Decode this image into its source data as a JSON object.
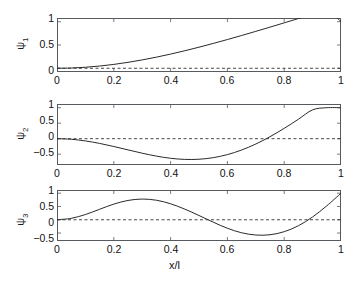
{
  "figure": {
    "background_color": "#ffffff",
    "axis_color": "#555b5e",
    "curve_color": "#2a2a2a",
    "zeroline_color": "#333333"
  },
  "xlabel": "x/l",
  "xticks": [
    "0",
    "0.2",
    "0.4",
    "0.6",
    "0.8",
    "1"
  ],
  "panels": [
    {
      "ylabel_main": "ψ",
      "ylabel_sub": "1",
      "yticks": [
        "1",
        "0.5",
        "0"
      ]
    },
    {
      "ylabel_main": "ψ",
      "ylabel_sub": "2",
      "yticks": [
        "1",
        "0.5",
        "0",
        "−0.5"
      ]
    },
    {
      "ylabel_main": "ψ",
      "ylabel_sub": "3",
      "yticks": [
        "1",
        "0.5",
        "0",
        "−0.5"
      ]
    }
  ],
  "chart_data": [
    {
      "type": "line",
      "title": "",
      "xlabel": "",
      "ylabel": "ψ₁",
      "xlim": [
        0,
        1
      ],
      "ylim": [
        -0.08,
        1.08
      ],
      "xticks": [
        0,
        0.2,
        0.4,
        0.6,
        0.8,
        1
      ],
      "yticks": [
        0,
        0.5,
        1
      ],
      "grid": false,
      "legend": null,
      "series": [
        {
          "name": "psi_1",
          "style": "solid",
          "x": [
            0,
            0.05,
            0.1,
            0.15,
            0.2,
            0.25,
            0.3,
            0.35,
            0.4,
            0.45,
            0.5,
            0.55,
            0.6,
            0.65,
            0.7,
            0.75,
            0.8,
            0.85,
            0.9,
            0.95,
            1
          ],
          "values": [
            0,
            0.0055,
            0.0216,
            0.0477,
            0.0832,
            0.1275,
            0.1797,
            0.2391,
            0.3049,
            0.3763,
            0.4527,
            0.5332,
            0.6172,
            0.7041,
            0.7932,
            0.8839,
            0.9758,
            1.0683,
            1.161,
            1.2535,
            1.0
          ]
        },
        {
          "name": "zero_reference",
          "style": "dashed",
          "x": [
            0,
            1
          ],
          "values": [
            0,
            0
          ]
        }
      ]
    },
    {
      "type": "line",
      "title": "",
      "xlabel": "",
      "ylabel": "ψ₂",
      "xlim": [
        0,
        1
      ],
      "ylim": [
        -0.85,
        1.12
      ],
      "xticks": [
        0,
        0.2,
        0.4,
        0.6,
        0.8,
        1
      ],
      "yticks": [
        -0.5,
        0,
        0.5,
        1
      ],
      "grid": false,
      "legend": null,
      "series": [
        {
          "name": "psi_2",
          "style": "solid",
          "x": [
            0,
            0.05,
            0.1,
            0.15,
            0.2,
            0.25,
            0.3,
            0.35,
            0.4,
            0.45,
            0.5,
            0.55,
            0.6,
            0.65,
            0.7,
            0.75,
            0.8,
            0.85,
            0.9,
            0.95,
            1
          ],
          "values": [
            0,
            -0.019,
            -0.072,
            -0.153,
            -0.253,
            -0.362,
            -0.469,
            -0.563,
            -0.633,
            -0.669,
            -0.664,
            -0.613,
            -0.514,
            -0.366,
            -0.172,
            0.064,
            0.334,
            0.628,
            0.932,
            1.0,
            1.0
          ]
        },
        {
          "name": "zero_reference",
          "style": "dashed",
          "x": [
            0,
            1
          ],
          "values": [
            0,
            0
          ]
        }
      ]
    },
    {
      "type": "line",
      "title": "",
      "xlabel": "x/l",
      "ylabel": "ψ₃",
      "xlim": [
        0,
        1
      ],
      "ylim": [
        -0.8,
        1.12
      ],
      "xticks": [
        0,
        0.2,
        0.4,
        0.6,
        0.8,
        1
      ],
      "yticks": [
        -0.5,
        0,
        0.5,
        1
      ],
      "grid": false,
      "legend": null,
      "series": [
        {
          "name": "psi_3",
          "style": "solid",
          "x": [
            0,
            0.05,
            0.1,
            0.15,
            0.2,
            0.25,
            0.3,
            0.35,
            0.4,
            0.45,
            0.5,
            0.55,
            0.6,
            0.65,
            0.7,
            0.75,
            0.8,
            0.85,
            0.9,
            0.95,
            1
          ],
          "values": [
            0,
            0.053,
            0.196,
            0.394,
            0.589,
            0.727,
            0.779,
            0.735,
            0.601,
            0.4,
            0.16,
            -0.09,
            -0.32,
            -0.49,
            -0.575,
            -0.565,
            -0.45,
            -0.225,
            0.105,
            0.525,
            1.0
          ]
        },
        {
          "name": "zero_reference",
          "style": "dashed",
          "x": [
            0,
            1
          ],
          "values": [
            0,
            0
          ]
        }
      ]
    }
  ]
}
